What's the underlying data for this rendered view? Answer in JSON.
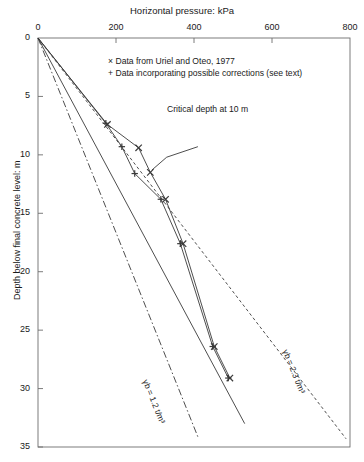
{
  "chart_data": {
    "type": "line",
    "title": "Horizontal pressure: kPa",
    "xlabel": "Horizontal pressure: kPa",
    "ylabel": "Depth below final concrete level: m",
    "xlim": [
      0,
      800
    ],
    "ylim": [
      0,
      35
    ],
    "xticks": [
      0,
      200,
      400,
      600,
      800
    ],
    "yticks": [
      0,
      5,
      10,
      15,
      20,
      25,
      30,
      35
    ],
    "grid": false,
    "y_axis_inverted": true,
    "legend_position": "upper-center",
    "legend": [
      {
        "marker": "x",
        "label": "Data from Uriel and Oteo, 1977"
      },
      {
        "marker": "+",
        "label": "Data incorporating possible corrections (see text)"
      }
    ],
    "series": [
      {
        "name": "Data from Uriel and Oteo, 1977",
        "marker": "x",
        "style": "solid",
        "points": [
          {
            "x": 178,
            "y": 7.4
          },
          {
            "x": 258,
            "y": 9.4
          },
          {
            "x": 288,
            "y": 11.5
          },
          {
            "x": 327,
            "y": 13.8
          },
          {
            "x": 372,
            "y": 17.6
          },
          {
            "x": 452,
            "y": 26.4
          },
          {
            "x": 492,
            "y": 29.1
          }
        ]
      },
      {
        "name": "Data incorporating possible corrections (see text)",
        "marker": "+",
        "style": "solid",
        "points": [
          {
            "x": 174,
            "y": 7.3
          },
          {
            "x": 215,
            "y": 9.3
          },
          {
            "x": 248,
            "y": 11.6
          },
          {
            "x": 315,
            "y": 13.8
          },
          {
            "x": 365,
            "y": 17.6
          },
          {
            "x": 448,
            "y": 26.4
          },
          {
            "x": 488,
            "y": 29.1
          }
        ]
      }
    ],
    "reference_lines": [
      {
        "name": "hydrostatic-gamma-1.2",
        "label": "γb = 1.2 t/m³",
        "style": "dash-dot",
        "from": {
          "x": 0,
          "y": 0
        },
        "to": {
          "x": 412,
          "y": 34.3
        }
      },
      {
        "name": "hydrostatic-gamma-2.3",
        "label": "γb = 2.3 t/m³",
        "style": "dashed",
        "from": {
          "x": 0,
          "y": 0
        },
        "to": {
          "x": 790,
          "y": 34.3
        }
      },
      {
        "name": "envelope-solid",
        "label": "",
        "style": "solid",
        "from": {
          "x": 0,
          "y": 0
        },
        "to": {
          "x": 530,
          "y": 33.0
        }
      }
    ],
    "annotations": [
      {
        "name": "critical-depth",
        "text": "Critical depth at 10 m",
        "x": 430,
        "y": 9.0
      }
    ]
  },
  "axis": {
    "xticklabels": [
      "0",
      "200",
      "400",
      "600",
      "800"
    ],
    "yticklabels": [
      "0",
      "5",
      "10",
      "15",
      "20",
      "25",
      "30",
      "35"
    ]
  },
  "legend": {
    "item0_marker": "×",
    "item0_text": "Data from Uriel and Oteo, 1977",
    "item1_marker": "+",
    "item1_text": "Data incorporating possible corrections (see text)"
  },
  "labels": {
    "title": "Horizontal pressure: kPa",
    "ylabel": "Depth below final concrete level: m",
    "critical": "Critical depth at 10 m",
    "gamma_low": "γb = 1.2 t/m³",
    "gamma_high": "γb = 2.3 t/m³"
  },
  "colors": {
    "line": "#3a3a3a",
    "axis": "#6e6e6e",
    "text": "#1a1a1a"
  }
}
